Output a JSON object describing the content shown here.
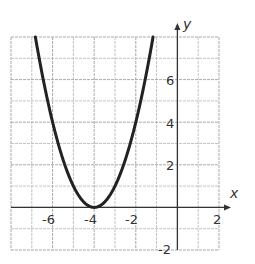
{
  "chart_data": {
    "type": "line",
    "title": "",
    "function": "y = (x + 4)^2",
    "xlabel": "x",
    "ylabel": "y",
    "xlim": [
      -8,
      2
    ],
    "ylim": [
      -2,
      8
    ],
    "grid": true,
    "x_ticks": [
      -6,
      -4,
      -2,
      2
    ],
    "y_ticks": [
      6,
      4,
      2,
      -2
    ],
    "x_tick_labels": [
      "-6",
      "-4",
      "-2",
      "2"
    ],
    "y_tick_labels": [
      "6",
      "4",
      "2",
      "-2"
    ],
    "series": [
      {
        "name": "parabola",
        "color": "#222222",
        "x": [
          -6.83,
          -6.5,
          -6,
          -5.5,
          -5,
          -4.5,
          -4,
          -3.5,
          -3,
          -2.5,
          -2,
          -1.5,
          -1.17
        ],
        "y": [
          8,
          6.25,
          4,
          2.25,
          1,
          0.25,
          0,
          0.25,
          1,
          2.25,
          4,
          6.25,
          8
        ]
      }
    ],
    "vertex": [
      -4,
      0
    ]
  },
  "labels": {
    "x_axis": "x",
    "y_axis": "y",
    "xt_m6": "-6",
    "xt_m4": "-4",
    "xt_m2": "-2",
    "xt_2": "2",
    "yt_6": "6",
    "yt_4": "4",
    "yt_2": "2",
    "yt_m2": "-2"
  }
}
